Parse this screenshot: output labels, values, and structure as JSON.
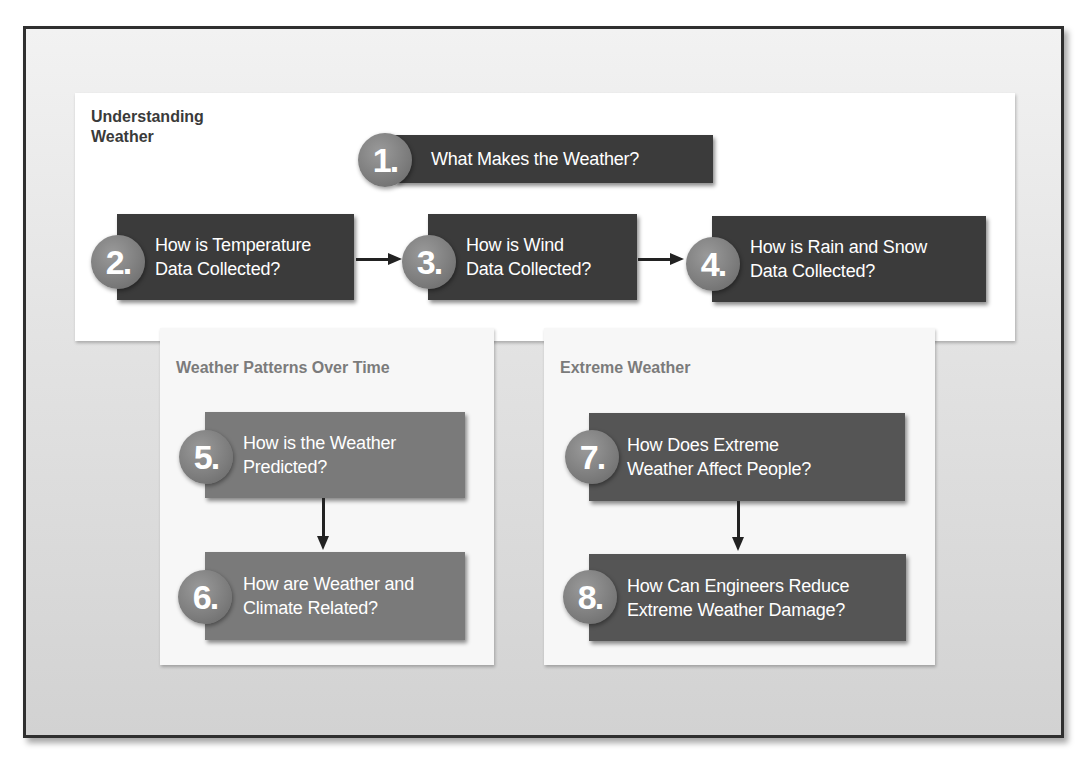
{
  "sections": {
    "understanding_weather": {
      "title": "Understanding\nWeather",
      "steps": [
        {
          "number": "1.",
          "label": "What Makes the Weather?"
        },
        {
          "number": "2.",
          "label": "How is Temperature\nData Collected?"
        },
        {
          "number": "3.",
          "label": "How is Wind\nData Collected?"
        },
        {
          "number": "4.",
          "label": "How is Rain and Snow\nData Collected?"
        }
      ]
    },
    "weather_patterns": {
      "title": "Weather Patterns Over Time",
      "steps": [
        {
          "number": "5.",
          "label": "How is the Weather\nPredicted?"
        },
        {
          "number": "6.",
          "label": "How are Weather and\nClimate Related?"
        }
      ]
    },
    "extreme_weather": {
      "title": "Extreme Weather",
      "steps": [
        {
          "number": "7.",
          "label": "How Does Extreme\nWeather Affect People?"
        },
        {
          "number": "8.",
          "label": "How Can Engineers Reduce\nExtreme Weather Damage?"
        }
      ]
    }
  },
  "colors": {
    "frame_border": "#2f2f2f",
    "dark_box": "#3b3b3b",
    "mid_box": "#7a7a7a",
    "extreme_box": "#555555",
    "badge": "#7c7c7c"
  }
}
